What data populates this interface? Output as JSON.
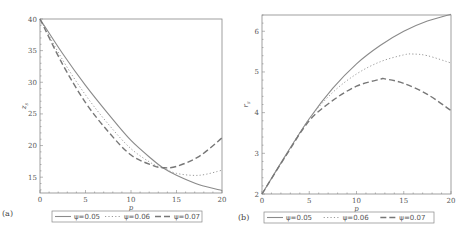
{
  "chart_data": [
    {
      "type": "line",
      "panel_label": "(a)",
      "title": "",
      "xlabel": "p",
      "ylabel": "z_s",
      "xlim": [
        0,
        20
      ],
      "ylim": [
        12.5,
        40
      ],
      "x_ticks": [
        "0",
        "5",
        "10",
        "15",
        "20"
      ],
      "y_ticks": [
        "15",
        "20",
        "25",
        "30",
        "35",
        "40"
      ],
      "grid": false,
      "legend_position": "bottom",
      "series": [
        {
          "name": "ψ=0.05",
          "style": "solid",
          "x": [
            0,
            2.5,
            5,
            7.5,
            10,
            12.5,
            13.5,
            15,
            17.5,
            20
          ],
          "y": [
            40,
            34.5,
            29.5,
            25,
            20.8,
            17.6,
            16.5,
            15.3,
            13.8,
            12.9
          ]
        },
        {
          "name": "ψ=0.06",
          "style": "dotted",
          "x": [
            0,
            2.5,
            5,
            7.5,
            10,
            12.5,
            13.5,
            15,
            17.5,
            20
          ],
          "y": [
            40,
            33.5,
            28,
            23.4,
            19.5,
            17.0,
            16.5,
            15.6,
            15.3,
            16.1
          ]
        },
        {
          "name": "ψ=0.07",
          "style": "dashed",
          "x": [
            0,
            2.5,
            5,
            7.5,
            10,
            12.5,
            13.5,
            15,
            17.5,
            20
          ],
          "y": [
            40,
            32.8,
            26.8,
            22.2,
            18.5,
            16.8,
            16.5,
            16.7,
            18.3,
            21.2
          ]
        }
      ]
    },
    {
      "type": "line",
      "panel_label": "(b)",
      "title": "",
      "xlabel": "p",
      "ylabel": "r_s",
      "xlim": [
        0,
        20
      ],
      "ylim": [
        2,
        6.4
      ],
      "x_ticks": [
        "0",
        "5",
        "10",
        "15",
        "20"
      ],
      "y_ticks": [
        "2",
        "3",
        "4",
        "5",
        "6"
      ],
      "grid": false,
      "legend_position": "bottom",
      "series": [
        {
          "name": "ψ=0.05",
          "style": "solid",
          "x": [
            0,
            2.5,
            5,
            7.5,
            10,
            12.5,
            15,
            17.5,
            20
          ],
          "y": [
            2,
            2.95,
            3.85,
            4.6,
            5.2,
            5.65,
            6.0,
            6.25,
            6.42
          ]
        },
        {
          "name": "ψ=0.06",
          "style": "dotted",
          "x": [
            0,
            2.5,
            5,
            7.5,
            10,
            12.5,
            15,
            16,
            17.5,
            20
          ],
          "y": [
            2,
            2.95,
            3.85,
            4.5,
            4.95,
            5.25,
            5.42,
            5.44,
            5.4,
            5.22
          ]
        },
        {
          "name": "ψ=0.07",
          "style": "dashed",
          "x": [
            0,
            2.5,
            5,
            7.5,
            10,
            12.5,
            13,
            15,
            17.5,
            20
          ],
          "y": [
            2,
            2.93,
            3.8,
            4.3,
            4.65,
            4.82,
            4.83,
            4.72,
            4.45,
            4.05
          ]
        }
      ]
    }
  ]
}
